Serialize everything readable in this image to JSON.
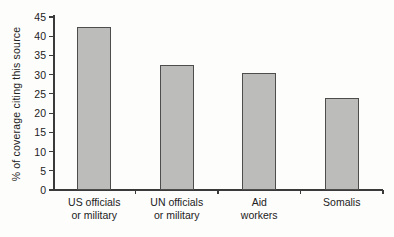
{
  "chart_data": {
    "type": "bar",
    "title": "",
    "xlabel": "",
    "ylabel": "% of coverage citing this source",
    "categories": [
      "US officials\nor military",
      "UN officials\nor military",
      "Aid\nworkers",
      "Somalis"
    ],
    "values": [
      42.5,
      32.5,
      30.5,
      24
    ],
    "ylim": [
      0,
      45
    ],
    "yticks": [
      0,
      5,
      10,
      15,
      20,
      25,
      30,
      35,
      40,
      45
    ],
    "grid": false,
    "legend": "none",
    "bar_fill": "#bcbcba",
    "bar_border": "#4d4d4d",
    "axis_color": "#3a3a3a",
    "text_color": "#222222",
    "background": "#fdfdfc"
  }
}
